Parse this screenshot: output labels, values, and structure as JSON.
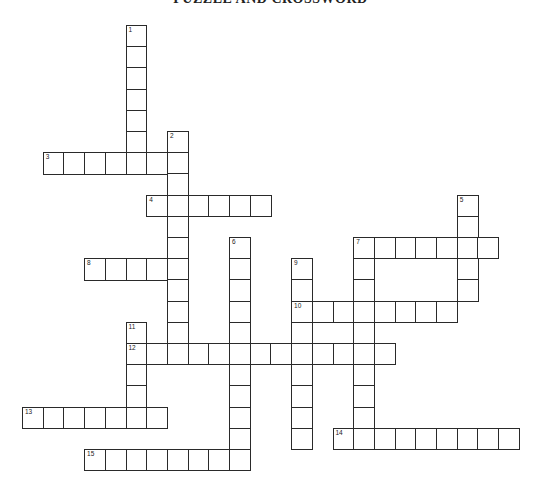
{
  "puzzle": {
    "title": "PUZZLE AND CROSSWORD",
    "colors": {
      "line": "#2a2a2a",
      "background": "#ffffff"
    },
    "words": [
      {
        "number": 1,
        "direction": "down",
        "row": 0,
        "col": 5,
        "length": 7
      },
      {
        "number": 2,
        "direction": "down",
        "row": 5,
        "col": 7,
        "length": 11
      },
      {
        "number": 3,
        "direction": "across",
        "row": 6,
        "col": 1,
        "length": 7
      },
      {
        "number": 4,
        "direction": "across",
        "row": 8,
        "col": 6,
        "length": 6
      },
      {
        "number": 5,
        "direction": "down",
        "row": 8,
        "col": 21,
        "length": 5
      },
      {
        "number": 6,
        "direction": "down",
        "row": 10,
        "col": 10,
        "length": 11
      },
      {
        "number": 7,
        "direction": "across",
        "row": 10,
        "col": 16,
        "length": 7
      },
      {
        "number": 7,
        "direction": "down",
        "row": 10,
        "col": 16,
        "length": 10
      },
      {
        "number": 8,
        "direction": "across",
        "row": 11,
        "col": 3,
        "length": 5
      },
      {
        "number": 9,
        "direction": "down",
        "row": 11,
        "col": 13,
        "length": 9
      },
      {
        "number": 10,
        "direction": "across",
        "row": 13,
        "col": 13,
        "length": 8
      },
      {
        "number": 11,
        "direction": "down",
        "row": 14,
        "col": 5,
        "length": 5
      },
      {
        "number": 12,
        "direction": "across",
        "row": 15,
        "col": 5,
        "length": 13
      },
      {
        "number": 13,
        "direction": "across",
        "row": 18,
        "col": 0,
        "length": 7
      },
      {
        "number": 14,
        "direction": "across",
        "row": 19,
        "col": 15,
        "length": 9
      },
      {
        "number": 15,
        "direction": "across",
        "row": 20,
        "col": 3,
        "length": 8
      }
    ]
  }
}
